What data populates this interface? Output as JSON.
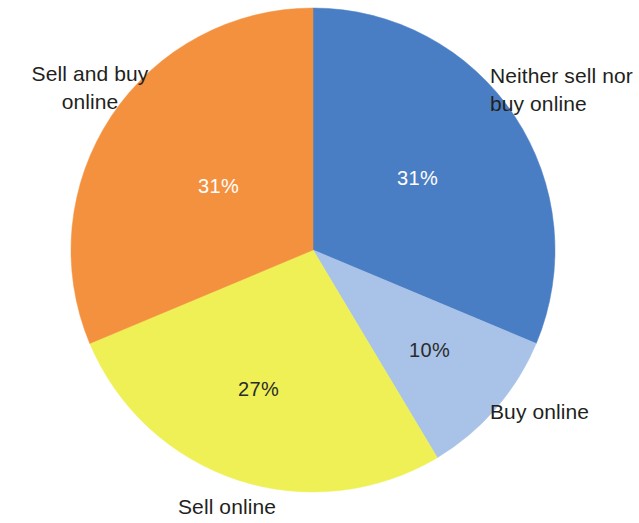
{
  "chart_data": {
    "type": "pie",
    "title": "",
    "subtitle": "",
    "xlabel": "",
    "ylabel": "",
    "legend_position": "outside-labels",
    "grid": false,
    "start_angle_deg": 0,
    "direction": "clockwise",
    "categories": [
      "Neither sell nor buy online",
      "Buy online",
      "Sell online",
      "Sell and buy online"
    ],
    "values": [
      31,
      10,
      27,
      31
    ],
    "value_labels": [
      "31%",
      "10%",
      "27%",
      "31%"
    ],
    "colors": [
      "#4a7ec4",
      "#a8c2e8",
      "#eef055",
      "#f4913f"
    ],
    "slices": [
      {
        "label": "Neither sell nor buy online",
        "label_display": "Neither sell nor\nbuy online",
        "value": 31,
        "value_label": "31%",
        "color": "#4a7ec4",
        "label_text_color": "#231f20",
        "value_text_color": "#ffffff"
      },
      {
        "label": "Buy online",
        "label_display": "Buy online",
        "value": 10,
        "value_label": "10%",
        "color": "#a8c2e8",
        "label_text_color": "#231f20",
        "value_text_color": "#2b2b2b"
      },
      {
        "label": "Sell online",
        "label_display": "Sell online",
        "value": 27,
        "value_label": "27%",
        "color": "#eef055",
        "label_text_color": "#231f20",
        "value_text_color": "#2b2b2b"
      },
      {
        "label": "Sell and buy online",
        "label_display": "Sell and buy\nonline",
        "value": 31,
        "value_label": "31%",
        "color": "#f4913f",
        "label_text_color": "#231f20",
        "value_text_color": "#ffffff"
      }
    ]
  },
  "geometry": {
    "center_x": 313,
    "center_y": 250,
    "radius": 242,
    "canvas_width": 639,
    "canvas_height": 523,
    "background": "#ffffff"
  }
}
